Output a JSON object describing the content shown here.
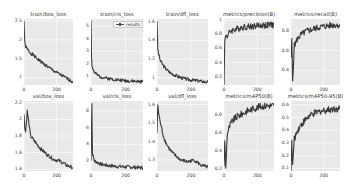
{
  "figure": {
    "layout": "2 rows x 5 columns of line plots",
    "line_color": "#3a3a3a",
    "plot_background": "#e9e9e9",
    "grid_color": "#ffffff"
  },
  "chart_data": [
    {
      "type": "line",
      "title": "train/box_loss",
      "legend": [
        "results"
      ],
      "xticks": [
        0,
        200
      ],
      "yticks": [
        1.0,
        1.5,
        2.0,
        2.5
      ],
      "xlim": [
        0,
        300
      ],
      "ylim": [
        0.8,
        2.55
      ],
      "x": [
        0,
        5,
        10,
        20,
        40,
        60,
        80,
        100,
        140,
        180,
        220,
        260,
        300
      ],
      "y": [
        2.5,
        1.9,
        1.82,
        1.75,
        1.65,
        1.58,
        1.5,
        1.43,
        1.3,
        1.18,
        1.08,
        0.98,
        0.88
      ]
    },
    {
      "type": "line",
      "title": "train/cls_loss",
      "legend": [
        "results"
      ],
      "xticks": [
        0,
        200
      ],
      "yticks": [
        1,
        2,
        3,
        4,
        5
      ],
      "xlim": [
        0,
        300
      ],
      "ylim": [
        0.3,
        5.6
      ],
      "x": [
        0,
        3,
        6,
        10,
        20,
        40,
        60,
        100,
        150,
        200,
        250,
        300
      ],
      "y": [
        5.5,
        2.5,
        1.9,
        1.6,
        1.3,
        1.05,
        0.95,
        0.82,
        0.72,
        0.65,
        0.6,
        0.55
      ]
    },
    {
      "type": "line",
      "title": "train/dfl_loss",
      "legend": [
        "results"
      ],
      "xticks": [
        0,
        200
      ],
      "yticks": [
        1.0,
        1.2,
        1.4,
        1.6
      ],
      "xlim": [
        0,
        300
      ],
      "ylim": [
        0.92,
        1.63
      ],
      "x": [
        0,
        5,
        10,
        20,
        40,
        60,
        80,
        100,
        140,
        180,
        220,
        260,
        300
      ],
      "y": [
        1.62,
        1.3,
        1.25,
        1.18,
        1.12,
        1.08,
        1.05,
        1.03,
        1.0,
        0.98,
        0.97,
        0.96,
        0.95
      ]
    },
    {
      "type": "line",
      "title": "metrics/precision(B)",
      "legend": [
        "results"
      ],
      "xticks": [
        0,
        200
      ],
      "yticks": [
        0.2,
        0.4,
        0.6,
        0.8,
        1.0
      ],
      "xlim": [
        0,
        300
      ],
      "ylim": [
        0.08,
        1.02
      ],
      "x": [
        0,
        5,
        10,
        20,
        40,
        60,
        80,
        100,
        140,
        180,
        220,
        260,
        300
      ],
      "y": [
        0.1,
        0.7,
        0.8,
        0.78,
        0.85,
        0.87,
        0.88,
        0.9,
        0.91,
        0.92,
        0.93,
        0.93,
        0.94
      ]
    },
    {
      "type": "line",
      "title": "metrics/recall(B)",
      "legend": [
        "results"
      ],
      "xticks": [
        0,
        200
      ],
      "yticks": [
        0.4,
        0.6,
        0.8
      ],
      "xlim": [
        0,
        300
      ],
      "ylim": [
        0.25,
        0.92
      ],
      "x": [
        0,
        5,
        10,
        20,
        40,
        60,
        80,
        100,
        140,
        180,
        220,
        260,
        300
      ],
      "y": [
        0.5,
        0.7,
        0.3,
        0.65,
        0.72,
        0.76,
        0.78,
        0.8,
        0.82,
        0.84,
        0.85,
        0.86,
        0.86
      ]
    },
    {
      "type": "line",
      "title": "val/box_loss",
      "legend": [
        "results"
      ],
      "xticks": [
        0,
        200
      ],
      "yticks": [
        1.4,
        1.6,
        1.8,
        2.0,
        2.2
      ],
      "xlim": [
        0,
        300
      ],
      "ylim": [
        1.38,
        2.22
      ],
      "x": [
        0,
        5,
        10,
        20,
        40,
        60,
        80,
        100,
        140,
        180,
        220,
        260,
        300
      ],
      "y": [
        2.05,
        1.9,
        1.85,
        2.1,
        1.8,
        1.75,
        1.7,
        1.65,
        1.58,
        1.52,
        1.5,
        1.45,
        1.42
      ]
    },
    {
      "type": "line",
      "title": "val/cls_loss",
      "legend": [
        "results"
      ],
      "xticks": [
        0,
        200
      ],
      "yticks": [
        2,
        4,
        6,
        8
      ],
      "xlim": [
        0,
        300
      ],
      "ylim": [
        0.8,
        9.2
      ],
      "x": [
        0,
        5,
        8,
        12,
        20,
        40,
        60,
        100,
        150,
        200,
        250,
        300
      ],
      "y": [
        2.0,
        9.0,
        3.0,
        2.6,
        2.0,
        1.8,
        1.6,
        1.45,
        1.35,
        1.3,
        1.25,
        1.2
      ]
    },
    {
      "type": "line",
      "title": "val/dfl_loss",
      "legend": [
        "results"
      ],
      "xticks": [
        0,
        200
      ],
      "yticks": [
        1.3,
        1.4,
        1.5,
        1.6
      ],
      "xlim": [
        0,
        300
      ],
      "ylim": [
        1.24,
        1.62
      ],
      "x": [
        0,
        5,
        10,
        20,
        40,
        60,
        80,
        100,
        140,
        180,
        220,
        260,
        300
      ],
      "y": [
        1.45,
        1.6,
        1.55,
        1.5,
        1.42,
        1.38,
        1.35,
        1.33,
        1.3,
        1.29,
        1.3,
        1.27,
        1.26
      ]
    },
    {
      "type": "line",
      "title": "metrics/mAP50(B)",
      "legend": [
        "results"
      ],
      "xticks": [
        0,
        200
      ],
      "yticks": [
        0.2,
        0.4,
        0.6,
        0.8
      ],
      "xlim": [
        0,
        300
      ],
      "ylim": [
        0.18,
        0.95
      ],
      "x": [
        0,
        5,
        10,
        20,
        40,
        60,
        80,
        100,
        140,
        180,
        220,
        260,
        300
      ],
      "y": [
        0.25,
        0.5,
        0.2,
        0.6,
        0.7,
        0.75,
        0.78,
        0.8,
        0.84,
        0.87,
        0.89,
        0.9,
        0.9
      ]
    },
    {
      "type": "line",
      "title": "metrics/mAP50-95(B)",
      "legend": [
        "results"
      ],
      "xticks": [
        0,
        200
      ],
      "yticks": [
        0.1,
        0.2,
        0.3,
        0.4,
        0.5,
        0.6
      ],
      "xlim": [
        0,
        300
      ],
      "ylim": [
        0.08,
        0.63
      ],
      "x": [
        0,
        5,
        10,
        20,
        40,
        60,
        80,
        100,
        140,
        180,
        220,
        260,
        300
      ],
      "y": [
        0.1,
        0.3,
        0.12,
        0.33,
        0.4,
        0.44,
        0.47,
        0.5,
        0.53,
        0.55,
        0.56,
        0.57,
        0.57
      ]
    }
  ]
}
